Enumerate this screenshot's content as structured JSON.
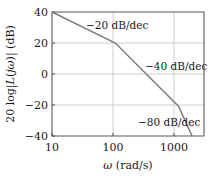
{
  "chart_data": {
    "type": "line",
    "title": "",
    "subtitle": "",
    "xlabel": "ω (rad/s)",
    "ylabel": "20 log|L(jω)| (dB)",
    "ylabel_parts": {
      "prefix": "20 log",
      "italic_L": "L",
      "open": "(",
      "italic_j": "j",
      "italic_w": "ω",
      "close": ")",
      "units": " (dB)"
    },
    "xscale": "log",
    "yscale": "linear",
    "xlim": [
      10,
      2512
    ],
    "ylim": [
      -40,
      40
    ],
    "grid": true,
    "legend": "none",
    "xticks": [
      10,
      100,
      1000
    ],
    "xticklabels": [
      "10",
      "100",
      "1000"
    ],
    "yticks": [
      -40,
      -20,
      0,
      20,
      40
    ],
    "yticklabels": [
      "−40",
      "−20",
      "0",
      "20",
      "40"
    ],
    "series": [
      {
        "name": "asymptotic magnitude",
        "color": "#7d7d7f",
        "x": [
          10,
          100,
          1000,
          2100
        ],
        "y": [
          40,
          20,
          -21,
          -50
        ],
        "segment_slopes_db_per_dec": [
          -20,
          -40,
          -80
        ]
      }
    ],
    "annotations": [
      {
        "id": "slope-1",
        "text": "−20 dB/dec",
        "x_data": 170,
        "y_data": 33,
        "slope": -20
      },
      {
        "id": "slope-2",
        "text": "−40 dB/dec",
        "x_data": 620,
        "y_data": 5,
        "slope": -40
      },
      {
        "id": "slope-3",
        "text": "−80 dB/dec",
        "x_data": 620,
        "y_data": -32,
        "slope": -80
      }
    ],
    "colors": {
      "curve": "#7d7d7f",
      "frame": "#59595b",
      "grid": "#c9c9cb",
      "text": "#1a1a1a",
      "background": "#ffffff"
    }
  }
}
